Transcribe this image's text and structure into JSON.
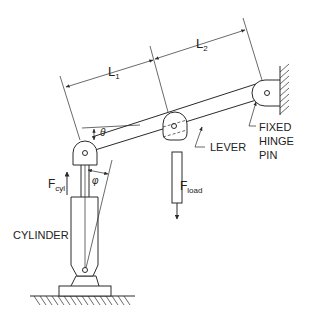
{
  "diagram": {
    "labels": {
      "L1": "L",
      "L1_sub": "1",
      "L2": "L",
      "L2_sub": "2",
      "theta": "θ",
      "phi": "φ",
      "fcyl": "F",
      "fcyl_sub": "cyl",
      "fload": "F",
      "fload_sub": "load",
      "lever": "LEVER",
      "cylinder": "CYLINDER",
      "fixed_line1": "FIXED",
      "fixed_line2": "HINGE",
      "fixed_line3": "PIN"
    },
    "components": [
      "cylinder",
      "lever",
      "load rod",
      "fixed hinge pin",
      "wall",
      "ground"
    ],
    "colors": {
      "line": "#2a2a2a",
      "background": "#ffffff"
    }
  }
}
